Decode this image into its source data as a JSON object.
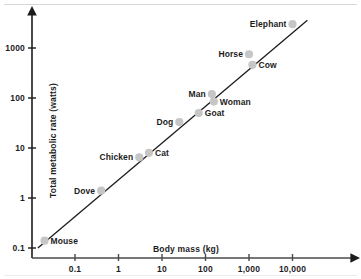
{
  "chart_data": {
    "type": "scatter",
    "title": "",
    "xlabel": "Body mass (kg)",
    "ylabel": "Total metabolic rate (watts)",
    "xscale": "log",
    "yscale": "log",
    "xlim": [
      0.012,
      60000
    ],
    "ylim": [
      0.085,
      5000
    ],
    "grid": false,
    "legend": "none",
    "xticks": [
      "0.1",
      "1",
      "10",
      "100",
      "1,000",
      "10,000"
    ],
    "xtick_values": [
      0.1,
      1,
      10,
      100,
      1000,
      10000
    ],
    "yticks": [
      "0.1",
      "1",
      "10",
      "100",
      "1000"
    ],
    "ytick_values": [
      0.1,
      1,
      10,
      100,
      1000
    ],
    "marker_color": "#c6c6c6",
    "line_color": "#1c1c1c",
    "text_color": "#1c1c1c",
    "trendline": {
      "label": "",
      "x": [
        0.014,
        22000
      ],
      "y": [
        0.1,
        3600
      ]
    },
    "points": [
      {
        "name": "Mouse",
        "x": 0.02,
        "y": 0.14,
        "label_side": "right"
      },
      {
        "name": "Dove",
        "x": 0.4,
        "y": 1.4,
        "label_side": "left"
      },
      {
        "name": "Chicken",
        "x": 3,
        "y": 6.5,
        "label_side": "left"
      },
      {
        "name": "Cat",
        "x": 5,
        "y": 8,
        "label_side": "right"
      },
      {
        "name": "Dog",
        "x": 25,
        "y": 33,
        "label_side": "left"
      },
      {
        "name": "Goat",
        "x": 70,
        "y": 50,
        "label_side": "right"
      },
      {
        "name": "Man",
        "x": 140,
        "y": 120,
        "label_side": "left"
      },
      {
        "name": "Woman",
        "x": 155,
        "y": 85,
        "label_side": "right"
      },
      {
        "name": "Horse",
        "x": 1000,
        "y": 750,
        "label_side": "left"
      },
      {
        "name": "Cow",
        "x": 1200,
        "y": 460,
        "label_side": "right"
      },
      {
        "name": "Elephant",
        "x": 10000,
        "y": 3000,
        "label_side": "left"
      }
    ]
  }
}
